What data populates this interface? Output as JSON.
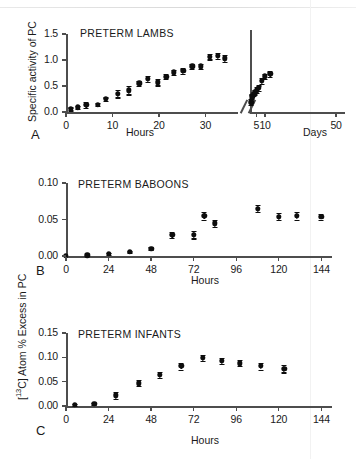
{
  "figure": {
    "shared_ylabel": "[13C] Atom % Excess in PC",
    "shared_ylabel_prefix": "[",
    "shared_ylabel_sup": "13",
    "shared_ylabel_suffix": "C] Atom % Excess in PC"
  },
  "chart_data": [
    {
      "type": "scatter",
      "panel": "A",
      "title": "PRETERM LAMBS",
      "ylabel": "Specific activity of PC",
      "xlabel": "Hours",
      "xlabel_right": "Days",
      "ylim": [
        0.0,
        1.5
      ],
      "yticks": [
        0.0,
        0.5,
        1.0,
        1.5
      ],
      "ytick_labels": [
        "0.0",
        "0.5",
        "1.0",
        "1.5"
      ],
      "xlim": [
        0,
        37
      ],
      "xticks": [
        0,
        10,
        20,
        30
      ],
      "xtick_labels": [
        "0",
        "10",
        "20",
        "30"
      ],
      "xlim_right": [
        1.5,
        55
      ],
      "xticks_right": [
        5,
        10,
        50
      ],
      "xtick_labels_right": [
        "5",
        "10",
        "50"
      ],
      "broken_axis": true,
      "grid": false,
      "legend": "none",
      "x": [
        1.0,
        2.6,
        4.4,
        6.8,
        8.6,
        11.2,
        13.5,
        15.8,
        17.6,
        19.8,
        21.6,
        23.2,
        25.2,
        27.2,
        29.0,
        31.0,
        32.6,
        34.2
      ],
      "y": [
        0.06,
        0.09,
        0.14,
        0.14,
        0.25,
        0.35,
        0.42,
        0.55,
        0.64,
        0.57,
        0.68,
        0.76,
        0.79,
        0.88,
        0.88,
        1.06,
        1.08,
        1.03
      ],
      "yerr": [
        0.03,
        0.03,
        0.06,
        0.03,
        0.03,
        0.07,
        0.08,
        0.05,
        0.06,
        0.06,
        0.05,
        0.05,
        0.05,
        0.05,
        0.05,
        0.05,
        0.06,
        0.07
      ],
      "x_right": [
        2.2,
        2.9,
        3.6,
        4.3,
        5.4,
        6.3,
        8.0,
        9.8,
        13.0
      ],
      "y_right": [
        0.19,
        0.3,
        0.35,
        0.38,
        0.42,
        0.46,
        0.6,
        0.69,
        0.73
      ],
      "yerr_right": [
        0.06,
        0.04,
        0.04,
        0.04,
        0.06,
        0.05,
        0.06,
        0.05,
        0.05
      ]
    },
    {
      "type": "scatter",
      "panel": "B",
      "title": "PRETERM BABOONS",
      "ylabel": "[13C] Atom % Excess in PC",
      "xlabel": "Hours",
      "ylim": [
        0.0,
        0.1
      ],
      "yticks": [
        0.0,
        0.05,
        0.1
      ],
      "ytick_labels": [
        "0.00",
        "0.05",
        "0.10"
      ],
      "xlim": [
        0,
        150
      ],
      "xticks": [
        0,
        24,
        48,
        72,
        96,
        120,
        144
      ],
      "xtick_labels": [
        "0",
        "24",
        "48",
        "72",
        "96",
        "120",
        "144"
      ],
      "grid": false,
      "legend": "none",
      "x": [
        0,
        12,
        24,
        36,
        48,
        60,
        72,
        78,
        84,
        108,
        120,
        130,
        144
      ],
      "y": [
        0.0,
        0.001,
        0.003,
        0.006,
        0.01,
        0.029,
        0.029,
        0.055,
        0.045,
        0.065,
        0.054,
        0.055,
        0.054
      ],
      "yerr": [
        0.0,
        0.0,
        0.001,
        0.001,
        0.002,
        0.004,
        0.005,
        0.005,
        0.005,
        0.005,
        0.005,
        0.005,
        0.004
      ]
    },
    {
      "type": "scatter",
      "panel": "C",
      "title": "PRETERM INFANTS",
      "ylabel": "[13C] Atom % Excess in PC",
      "xlabel": "Hours",
      "ylim": [
        0.0,
        0.15
      ],
      "yticks": [
        0.0,
        0.05,
        0.1,
        0.15
      ],
      "ytick_labels": [
        "0.00",
        "0.05",
        "0.10",
        "0.15"
      ],
      "xlim": [
        0,
        150
      ],
      "xticks": [
        0,
        24,
        48,
        72,
        96,
        120,
        144
      ],
      "xtick_labels": [
        "0",
        "24",
        "48",
        "72",
        "96",
        "120",
        "144"
      ],
      "grid": false,
      "legend": "none",
      "x": [
        5,
        16,
        28,
        41,
        53,
        65,
        77,
        88,
        98,
        110,
        123
      ],
      "y": [
        0.003,
        0.005,
        0.022,
        0.047,
        0.064,
        0.082,
        0.099,
        0.093,
        0.088,
        0.082,
        0.077
      ],
      "yerr": [
        0.002,
        0.002,
        0.007,
        0.006,
        0.006,
        0.007,
        0.006,
        0.006,
        0.006,
        0.007,
        0.008
      ]
    }
  ]
}
